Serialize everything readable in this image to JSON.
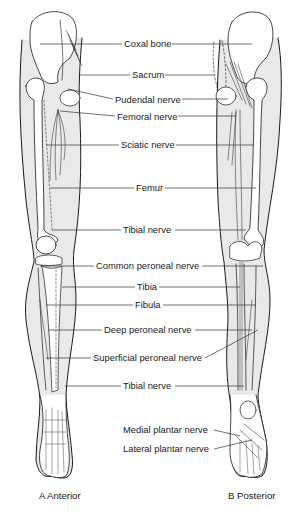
{
  "figure": {
    "type": "anatomical-diagram",
    "colors": {
      "outline": "#1a1a1a",
      "leader": "#333333",
      "skin_fill": "#e9e9e9",
      "bone_fill": "#ffffff",
      "background": "#ffffff"
    },
    "labels": [
      {
        "id": "coxal-bone",
        "text": "Coxal bone",
        "x": 123,
        "y": 10
      },
      {
        "id": "sacrum",
        "text": "Sacrum",
        "x": 131,
        "y": 70
      },
      {
        "id": "pudendal-nerve",
        "text": "Pudendal nerve",
        "x": 114,
        "y": 93
      },
      {
        "id": "femoral-nerve",
        "text": "Femoral nerve",
        "x": 116,
        "y": 111
      },
      {
        "id": "sciatic-nerve",
        "text": "Sciatic nerve",
        "x": 120,
        "y": 140
      },
      {
        "id": "femur",
        "text": "Femur",
        "x": 135,
        "y": 183
      },
      {
        "id": "tibial-nerve-upper",
        "text": "Tibial nerve",
        "x": 122,
        "y": 225
      },
      {
        "id": "common-peroneal-nerve",
        "text": "Common peroneal nerve",
        "x": 95,
        "y": 262
      },
      {
        "id": "tibia",
        "text": "Tibia",
        "x": 136,
        "y": 284
      },
      {
        "id": "fibula",
        "text": "Fibula",
        "x": 134,
        "y": 302
      },
      {
        "id": "deep-peroneal-nerve",
        "text": "Deep peroneal nerve",
        "x": 103,
        "y": 327
      },
      {
        "id": "superficial-peroneal-nerve",
        "text": "Superficial peroneal nerve",
        "x": 92,
        "y": 353
      },
      {
        "id": "tibial-nerve-lower",
        "text": "Tibial nerve",
        "x": 122,
        "y": 381
      },
      {
        "id": "medial-plantar-nerve",
        "text": "Medial plantar nerve",
        "x": 122,
        "y": 424
      },
      {
        "id": "lateral-plantar-nerve",
        "text": "Lateral plantar nerve",
        "x": 122,
        "y": 444
      }
    ],
    "captions": [
      {
        "id": "anterior",
        "text": "A Anterior",
        "x": 39,
        "y": 490
      },
      {
        "id": "posterior",
        "text": "B Posterior",
        "x": 228,
        "y": 490
      }
    ]
  }
}
